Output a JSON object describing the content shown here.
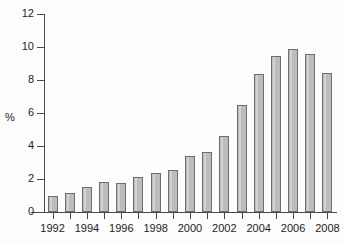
{
  "chart_data": {
    "type": "bar",
    "title": "",
    "xlabel": "",
    "ylabel": "%",
    "ylim": [
      0,
      12
    ],
    "ytick_values": [
      0,
      2,
      4,
      6,
      8,
      10,
      12
    ],
    "ytick_labels": [
      "0",
      "2",
      "4",
      "6",
      "8",
      "10",
      "12"
    ],
    "grid": false,
    "legend": false,
    "categories": [
      "1992",
      "1993",
      "1994",
      "1995",
      "1996",
      "1997",
      "1998",
      "1999",
      "2000",
      "2001",
      "2002",
      "2003",
      "2004",
      "2005",
      "2006",
      "2007",
      "2008"
    ],
    "xtick_labels_shown": [
      "1992",
      "1994",
      "1996",
      "1998",
      "2000",
      "2002",
      "2004",
      "2006",
      "2008"
    ],
    "values": [
      0.95,
      1.15,
      1.5,
      1.8,
      1.78,
      2.1,
      2.35,
      2.55,
      3.4,
      3.65,
      4.6,
      6.5,
      8.35,
      9.45,
      9.9,
      9.55,
      8.4
    ],
    "bar_color": "#bcbcbc",
    "bar_edge_color": "#6e6e6e"
  }
}
